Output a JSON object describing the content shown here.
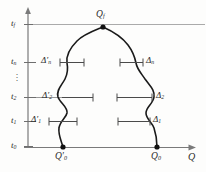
{
  "figure": {
    "axes": {
      "y_axis_name": "t",
      "x_axis_label": "Q",
      "x_axis_label_name": "q-axis-label"
    },
    "y_ticks": [
      {
        "key": "tf",
        "label": "t",
        "sub": "f",
        "y": 24
      },
      {
        "key": "tn",
        "label": "t",
        "sub": "n",
        "y": 62
      },
      {
        "key": "t2",
        "label": "t",
        "sub": "2",
        "y": 97
      },
      {
        "key": "t1",
        "label": "t",
        "sub": "1",
        "y": 121
      },
      {
        "key": "t0",
        "label": "t",
        "sub": "0",
        "y": 146
      }
    ],
    "ellipsis": "⋮",
    "points": [
      {
        "key": "qf",
        "label": "Q",
        "sub": "f",
        "x": 103,
        "y": 27
      },
      {
        "key": "q0prime",
        "label": "Q′",
        "sub": "0",
        "x": 63,
        "y": 147
      },
      {
        "key": "q0",
        "label": "Q",
        "sub": "0",
        "x": 157,
        "y": 147
      }
    ],
    "increments": [
      {
        "key": "dn_prime",
        "label": "Δ′",
        "sub": "n",
        "side": "left",
        "y": 62
      },
      {
        "key": "dn",
        "label": "Δ",
        "sub": "n",
        "side": "right",
        "y": 62
      },
      {
        "key": "d2_prime",
        "label": "Δ′",
        "sub": "2",
        "side": "left",
        "y": 97
      },
      {
        "key": "d2",
        "label": "Δ",
        "sub": "2",
        "side": "right",
        "y": 97
      },
      {
        "key": "d1_prime",
        "label": "Δ′",
        "sub": "1",
        "side": "left",
        "y": 121
      },
      {
        "key": "d1",
        "label": "Δ",
        "sub": "1",
        "side": "right",
        "y": 121
      }
    ],
    "colors": {
      "ink": "#2b2b2b",
      "axis": "#7a7a7a",
      "grid": "#9a9a9a",
      "curve": "#1a1a1a",
      "paper": "#fdfdfc"
    }
  }
}
